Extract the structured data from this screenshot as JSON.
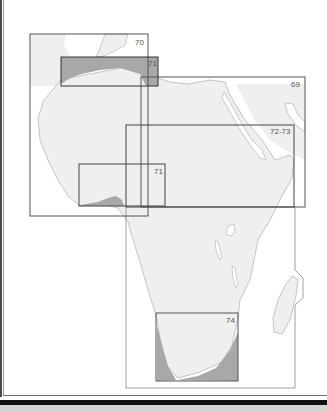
{
  "map": {
    "title": "Africa map index",
    "colors": {
      "land": "#efefef",
      "sea": "#ffffff",
      "coast": "#b8b8b8",
      "frame": "#555555",
      "shade": "#a8a8a8"
    },
    "index_boxes": [
      {
        "label": "70",
        "x": 30,
        "y": 34,
        "w": 118,
        "h": 182
      },
      {
        "label": "71",
        "x": 61,
        "y": 57,
        "w": 97,
        "h": 29
      },
      {
        "label": "69",
        "x": 141,
        "y": 77,
        "w": 164,
        "h": 130
      },
      {
        "label": "72-73",
        "x": 126,
        "y": 125,
        "w": 168,
        "h": 263
      },
      {
        "label": "71",
        "x": 79,
        "y": 164,
        "w": 86,
        "h": 42
      },
      {
        "label": "74",
        "x": 156,
        "y": 313,
        "w": 82,
        "h": 68
      }
    ]
  }
}
